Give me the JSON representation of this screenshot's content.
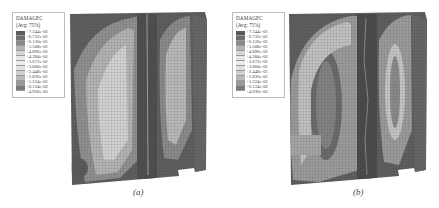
{
  "figure": {
    "panels": [
      {
        "id": "a",
        "caption": "(a)",
        "legend": {
          "title": "DAMAGEC",
          "subtitle": "(Avg: 75%)",
          "values": [
            "+7.344e-01",
            "+6.732e-01",
            "+6.120e-01",
            "+5.508e-01",
            "+4.896e-01",
            "+4.284e-01",
            "+3.672e-01",
            "+3.060e-01",
            "+2.448e-01",
            "+1.836e-01",
            "+1.224e-01",
            "+6.124e-02",
            "+4.936e-05"
          ],
          "swatch_colors": [
            "#5a5a5a",
            "#6e6e6e",
            "#8a8a8a",
            "#b4b4b4",
            "#d6d6d6",
            "#e6e6e6",
            "#ececec",
            "#e0e0e0",
            "#cfcfcf",
            "#b8b8b8",
            "#9a9a9a",
            "#7a7a7a"
          ]
        }
      },
      {
        "id": "b",
        "caption": "(b)",
        "legend": {
          "title": "DAMAGEC",
          "subtitle": "(Avg: 75%)",
          "values": [
            "+7.344e-01",
            "+6.732e-01",
            "+6.120e-01",
            "+5.508e-01",
            "+4.896e-01",
            "+4.284e-01",
            "+3.672e-01",
            "+3.060e-01",
            "+2.448e-01",
            "+1.836e-01",
            "+1.224e-01",
            "+6.124e-02",
            "+4.936e-05"
          ],
          "swatch_colors": [
            "#5a5a5a",
            "#6e6e6e",
            "#8a8a8a",
            "#b4b4b4",
            "#d6d6d6",
            "#e6e6e6",
            "#ececec",
            "#e0e0e0",
            "#cfcfcf",
            "#b8b8b8",
            "#9a9a9a",
            "#7a7a7a"
          ]
        }
      }
    ],
    "colors": {
      "dark_damage": "#4f4f4f",
      "mid_damage": "#8c8c8c",
      "light_damage": "#c8c8c8",
      "mesh_line": "#3a3a3a"
    }
  }
}
